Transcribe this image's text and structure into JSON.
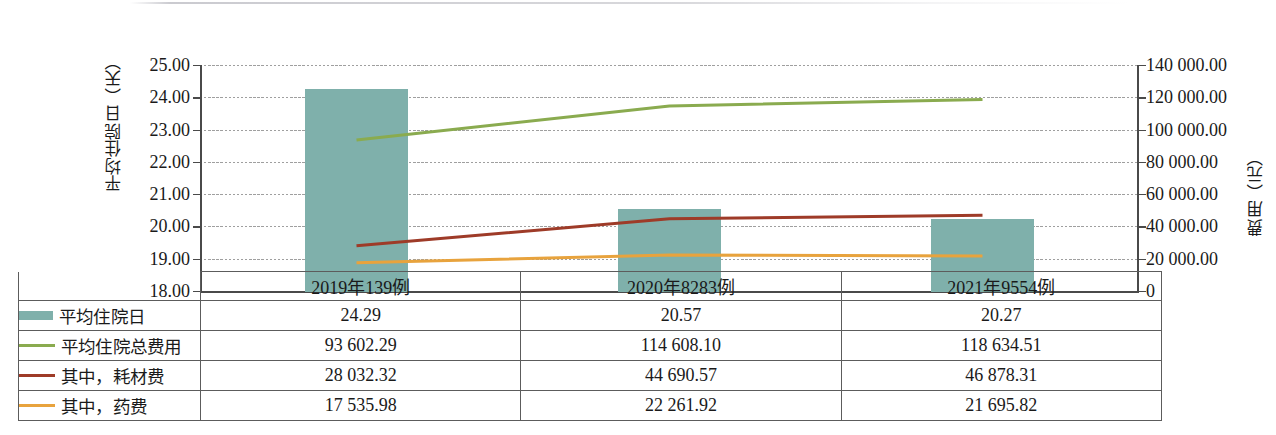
{
  "axes": {
    "left_title": "平均住院日（天）",
    "right_title": "费用（元）",
    "left_ticks": [
      "25.00",
      "24.00",
      "23.00",
      "22.00",
      "21.00",
      "20.00",
      "19.00",
      "18.00"
    ],
    "right_ticks": [
      "140 000.00",
      "120 000.00",
      "100 000.00",
      "80 000.00",
      "60 000.00",
      "40 000.00",
      "20 000.00",
      "0"
    ]
  },
  "table": {
    "corner_label": "",
    "categories": [
      "2019年139例",
      "2020年8283例",
      "2021年9554例"
    ],
    "rows": [
      {
        "label": "平均住院日",
        "marker": "bar",
        "color": "#7fb0ab",
        "values": [
          "24.29",
          "20.57",
          "20.27"
        ]
      },
      {
        "label": "平均住院总费用",
        "marker": "line",
        "color": "#8aab4f",
        "values": [
          "93 602.29",
          "114 608.10",
          "118 634.51"
        ]
      },
      {
        "label": "其中，耗材费",
        "marker": "line",
        "color": "#9e3b28",
        "values": [
          "28 032.32",
          "44 690.57",
          "46 878.31"
        ]
      },
      {
        "label": "其中，药费",
        "marker": "line",
        "color": "#e8a33d",
        "values": [
          "17 535.98",
          "22 261.92",
          "21 695.82"
        ]
      }
    ]
  },
  "chart_data": {
    "type": "bar",
    "title": "",
    "xlabel": "",
    "ylabel": "平均住院日（天）",
    "y2label": "费用（元）",
    "categories": [
      "2019年139例",
      "2020年8283例",
      "2021年9554例"
    ],
    "ylim": [
      18.0,
      25.0
    ],
    "ytick_step": 1.0,
    "y2lim": [
      0,
      140000
    ],
    "y2tick_step": 20000,
    "grid": true,
    "legend_position": "table-below",
    "series": [
      {
        "name": "平均住院日",
        "type": "bar",
        "axis": "left",
        "color": "#7fb0ab",
        "values": [
          24.29,
          20.57,
          20.27
        ]
      },
      {
        "name": "平均住院总费用",
        "type": "line",
        "axis": "right",
        "color": "#8aab4f",
        "values": [
          93602.29,
          114608.1,
          118634.51
        ]
      },
      {
        "name": "其中，耗材费",
        "type": "line",
        "axis": "right",
        "color": "#9e3b28",
        "values": [
          28032.32,
          44690.57,
          46878.31
        ]
      },
      {
        "name": "其中，药费",
        "type": "line",
        "axis": "right",
        "color": "#e8a33d",
        "values": [
          17535.98,
          22261.92,
          21695.82
        ]
      }
    ]
  }
}
